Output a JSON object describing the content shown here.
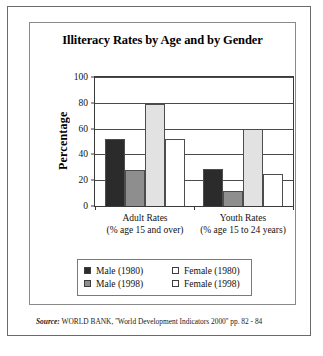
{
  "chart_data": {
    "type": "bar",
    "title": "Illiteracy Rates by Age and by Gender",
    "xlabel": "",
    "ylabel": "Percentage",
    "ylim": [
      0,
      100
    ],
    "yticks": [
      0,
      20,
      40,
      60,
      80,
      100
    ],
    "grid": true,
    "legend_position": "bottom",
    "categories": [
      "Adult Rates",
      "Youth Rates"
    ],
    "category_sublabels": [
      "(% age 15 and over)",
      "(% age 15 to 24 years)"
    ],
    "series": [
      {
        "name": "Male (1980)",
        "swatch": "dark",
        "values": [
          52,
          29
        ]
      },
      {
        "name": "Male (1998)",
        "swatch": "gray",
        "values": [
          28,
          12
        ]
      },
      {
        "name": "Female (1980)",
        "swatch": "light",
        "values": [
          79,
          60
        ]
      },
      {
        "name": "Female (1998)",
        "swatch": "white",
        "values": [
          52,
          25
        ]
      }
    ],
    "colors": {
      "male_1980": "#2b2b2b",
      "male_1998": "#8e8e8e",
      "female_1980": "#e2e2e2",
      "female_1998": "#ffffff",
      "axis": "#3a3a3a",
      "frame": "#6b6b6b"
    }
  },
  "source": {
    "label": "Source:",
    "text": "WORLD BANK, ''World Development Indicators 2000'' pp. 82 - 84"
  }
}
